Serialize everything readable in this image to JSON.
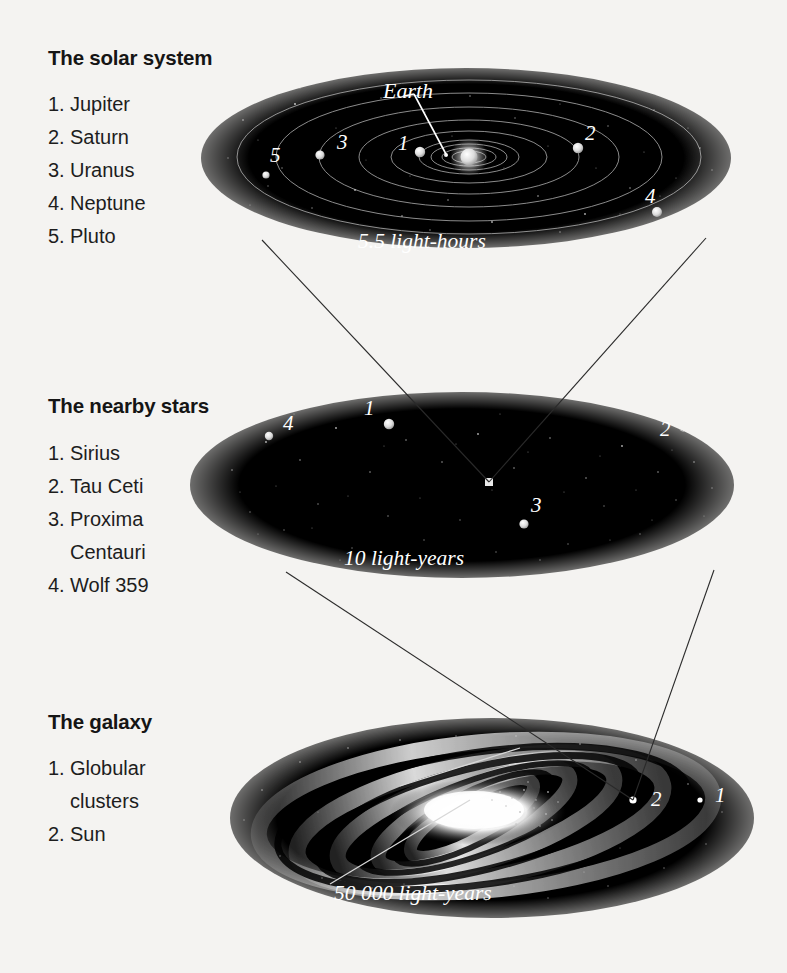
{
  "figure": {
    "kind": "three-tier cosmic scale diagram",
    "background_color": "#f4f3f1",
    "ink_color": "#151515",
    "space_color": "#000000",
    "star_color": "#ffffff"
  },
  "panels": [
    {
      "id": "solar-system",
      "title": "The solar system",
      "scale_label": "5.5 light-hours",
      "callout": "Earth",
      "legend": [
        {
          "num": "1.",
          "label": "Jupiter"
        },
        {
          "num": "2.",
          "label": "Saturn"
        },
        {
          "num": "3.",
          "label": "Uranus"
        },
        {
          "num": "4.",
          "label": "Neptune"
        },
        {
          "num": "5.",
          "label": "Pluto"
        }
      ],
      "markers": [
        {
          "num": "1",
          "name": "Jupiter"
        },
        {
          "num": "2",
          "name": "Saturn"
        },
        {
          "num": "3",
          "name": "Uranus"
        },
        {
          "num": "4",
          "name": "Neptune"
        },
        {
          "num": "5",
          "name": "Pluto"
        }
      ]
    },
    {
      "id": "nearby-stars",
      "title": "The nearby stars",
      "scale_label": "10 light-years",
      "legend": [
        {
          "num": "1.",
          "label": "Sirius"
        },
        {
          "num": "2.",
          "label": "Tau Ceti"
        },
        {
          "num": "3.",
          "label": "Proxima",
          "label_cont": "Centauri"
        },
        {
          "num": "4.",
          "label": "Wolf 359"
        }
      ],
      "markers": [
        {
          "num": "1",
          "name": "Sirius"
        },
        {
          "num": "2",
          "name": "Tau Ceti"
        },
        {
          "num": "3",
          "name": "Proxima Centauri"
        },
        {
          "num": "4",
          "name": "Wolf 359"
        }
      ]
    },
    {
      "id": "galaxy",
      "title": "The galaxy",
      "scale_label": "50 000 light-years",
      "legend": [
        {
          "num": "1.",
          "label": "Globular",
          "label_cont": "clusters"
        },
        {
          "num": "2.",
          "label": "Sun"
        }
      ],
      "markers": [
        {
          "num": "1",
          "name": "Globular clusters"
        },
        {
          "num": "2",
          "name": "Sun"
        }
      ]
    }
  ]
}
